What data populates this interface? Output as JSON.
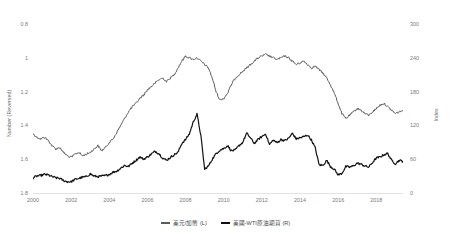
{
  "chart_data": {
    "type": "line",
    "title": "",
    "xlabel": "",
    "ylabel": "Number (Reversed)",
    "ylabel_right": "Index",
    "grid": false,
    "legend_position": "bottom-center",
    "x_tick_labels": [
      "2000",
      "2002",
      "2004",
      "2006",
      "2008",
      "2010",
      "2012",
      "2014",
      "2016",
      "2018"
    ],
    "x_tick_values": [
      2000,
      2002,
      2004,
      2006,
      2008,
      2010,
      2012,
      2014,
      2016,
      2018
    ],
    "xlim": [
      2000,
      2019.4
    ],
    "y_left_tick_labels": [
      "0.8",
      "1",
      "1.2",
      "1.4",
      "1.6",
      "1.8"
    ],
    "y_left_tick_values": [
      0.8,
      1.0,
      1.2,
      1.4,
      1.6,
      1.8
    ],
    "ylim_left": [
      1.8,
      0.8
    ],
    "y_left_inverted": true,
    "y_right_tick_labels": [
      "300",
      "240",
      "180",
      "120",
      "60",
      "0"
    ],
    "y_right_tick_values": [
      300,
      240,
      180,
      120,
      60,
      0
    ],
    "ylim_right": [
      0,
      300
    ],
    "series": [
      {
        "name": "美元/加幣 (L)",
        "axis": "left",
        "color": "#5a5a5a",
        "x": [
          2000.0,
          2000.2,
          2000.4,
          2000.6,
          2000.8,
          2001.0,
          2001.2,
          2001.4,
          2001.6,
          2001.8,
          2002.0,
          2002.2,
          2002.4,
          2002.6,
          2002.8,
          2003.0,
          2003.2,
          2003.4,
          2003.6,
          2003.8,
          2004.0,
          2004.2,
          2004.4,
          2004.6,
          2004.8,
          2005.0,
          2005.2,
          2005.4,
          2005.6,
          2005.8,
          2006.0,
          2006.2,
          2006.4,
          2006.6,
          2006.8,
          2007.0,
          2007.2,
          2007.4,
          2007.6,
          2007.8,
          2008.0,
          2008.2,
          2008.4,
          2008.6,
          2008.8,
          2009.0,
          2009.2,
          2009.4,
          2009.6,
          2009.8,
          2010.0,
          2010.2,
          2010.4,
          2010.6,
          2010.8,
          2011.0,
          2011.2,
          2011.4,
          2011.6,
          2011.8,
          2012.0,
          2012.2,
          2012.4,
          2012.6,
          2012.8,
          2013.0,
          2013.2,
          2013.4,
          2013.6,
          2013.8,
          2014.0,
          2014.2,
          2014.4,
          2014.6,
          2014.8,
          2015.0,
          2015.2,
          2015.4,
          2015.6,
          2015.8,
          2016.0,
          2016.2,
          2016.4,
          2016.6,
          2016.8,
          2017.0,
          2017.2,
          2017.4,
          2017.6,
          2017.8,
          2018.0,
          2018.2,
          2018.4,
          2018.6,
          2018.8,
          2019.0,
          2019.2,
          2019.4
        ],
        "values": [
          1.45,
          1.47,
          1.48,
          1.47,
          1.49,
          1.52,
          1.54,
          1.53,
          1.56,
          1.58,
          1.59,
          1.57,
          1.56,
          1.58,
          1.57,
          1.56,
          1.54,
          1.52,
          1.55,
          1.53,
          1.5,
          1.48,
          1.44,
          1.4,
          1.36,
          1.32,
          1.29,
          1.27,
          1.24,
          1.22,
          1.19,
          1.17,
          1.15,
          1.13,
          1.12,
          1.14,
          1.12,
          1.1,
          1.06,
          1.02,
          0.99,
          1.0,
          1.01,
          1.0,
          1.02,
          1.04,
          1.06,
          1.12,
          1.2,
          1.25,
          1.24,
          1.21,
          1.16,
          1.12,
          1.1,
          1.08,
          1.06,
          1.04,
          1.02,
          1.0,
          0.99,
          0.98,
          0.99,
          1.0,
          1.01,
          1.0,
          0.99,
          1.0,
          1.02,
          1.04,
          1.03,
          1.02,
          1.04,
          1.06,
          1.05,
          1.07,
          1.09,
          1.12,
          1.16,
          1.21,
          1.27,
          1.33,
          1.36,
          1.34,
          1.32,
          1.3,
          1.31,
          1.33,
          1.34,
          1.32,
          1.3,
          1.28,
          1.27,
          1.29,
          1.31,
          1.33,
          1.32,
          1.31
        ]
      },
      {
        "name": "美國-WTI原油期貨 (R)",
        "axis": "right",
        "color": "#111111",
        "x": [
          2000.0,
          2000.2,
          2000.4,
          2000.6,
          2000.8,
          2001.0,
          2001.2,
          2001.4,
          2001.6,
          2001.8,
          2002.0,
          2002.2,
          2002.4,
          2002.6,
          2002.8,
          2003.0,
          2003.2,
          2003.4,
          2003.6,
          2003.8,
          2004.0,
          2004.2,
          2004.4,
          2004.6,
          2004.8,
          2005.0,
          2005.2,
          2005.4,
          2005.6,
          2005.8,
          2006.0,
          2006.2,
          2006.4,
          2006.6,
          2006.8,
          2007.0,
          2007.2,
          2007.4,
          2007.6,
          2007.8,
          2008.0,
          2008.2,
          2008.4,
          2008.6,
          2008.8,
          2009.0,
          2009.2,
          2009.4,
          2009.6,
          2009.8,
          2010.0,
          2010.2,
          2010.4,
          2010.6,
          2010.8,
          2011.0,
          2011.2,
          2011.4,
          2011.6,
          2011.8,
          2012.0,
          2012.2,
          2012.4,
          2012.6,
          2012.8,
          2013.0,
          2013.2,
          2013.4,
          2013.6,
          2013.8,
          2014.0,
          2014.2,
          2014.4,
          2014.6,
          2014.8,
          2015.0,
          2015.2,
          2015.4,
          2015.6,
          2015.8,
          2016.0,
          2016.2,
          2016.4,
          2016.6,
          2016.8,
          2017.0,
          2017.2,
          2017.4,
          2017.6,
          2017.8,
          2018.0,
          2018.2,
          2018.4,
          2018.6,
          2018.8,
          2019.0,
          2019.2,
          2019.4
        ],
        "values": [
          27,
          30,
          31,
          33,
          32,
          29,
          27,
          26,
          22,
          20,
          20,
          24,
          26,
          28,
          29,
          34,
          30,
          29,
          30,
          31,
          33,
          37,
          39,
          44,
          49,
          47,
          53,
          58,
          64,
          60,
          64,
          69,
          74,
          70,
          62,
          58,
          63,
          68,
          72,
          88,
          95,
          105,
          126,
          140,
          102,
          42,
          48,
          60,
          70,
          76,
          79,
          84,
          75,
          76,
          84,
          90,
          106,
          98,
          88,
          95,
          100,
          105,
          86,
          94,
          89,
          95,
          93,
          97,
          106,
          96,
          98,
          100,
          103,
          94,
          80,
          50,
          49,
          58,
          47,
          42,
          32,
          35,
          47,
          46,
          48,
          53,
          51,
          48,
          46,
          54,
          62,
          64,
          68,
          70,
          58,
          52,
          58,
          56
        ]
      }
    ]
  },
  "axes": {
    "left_label": "Number (Reversed)",
    "right_label": "Index"
  },
  "legend": {
    "items": [
      {
        "label": "美元/加幣 (L)",
        "color": "#5a5a5a"
      },
      {
        "label": "美國-WTI原油期貨 (R)",
        "color": "#111111"
      }
    ]
  }
}
